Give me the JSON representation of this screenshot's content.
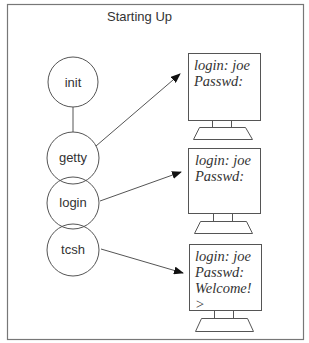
{
  "title": "Starting Up",
  "colors": {
    "stroke": "#555555",
    "frame": "#777777",
    "text": "#333333",
    "background": "#ffffff"
  },
  "processes": [
    {
      "id": "init",
      "label": "init"
    },
    {
      "id": "getty",
      "label": "getty"
    },
    {
      "id": "login",
      "label": "login"
    },
    {
      "id": "tcsh",
      "label": "tcsh"
    }
  ],
  "terminals": [
    {
      "id": "terminal-1",
      "lines": [
        "login: joe",
        "Passwd:"
      ]
    },
    {
      "id": "terminal-2",
      "lines": [
        "login: joe",
        "Passwd:"
      ]
    },
    {
      "id": "terminal-3",
      "lines": [
        "login: joe",
        "Passwd:",
        "Welcome!",
        ">"
      ]
    }
  ],
  "connections": [
    {
      "from": "init",
      "to": "getty",
      "type": "line"
    },
    {
      "from": "getty",
      "to": "terminal-1",
      "type": "arrow"
    },
    {
      "from": "login",
      "to": "terminal-2",
      "type": "arrow"
    },
    {
      "from": "tcsh",
      "to": "terminal-3",
      "type": "arrow"
    }
  ]
}
